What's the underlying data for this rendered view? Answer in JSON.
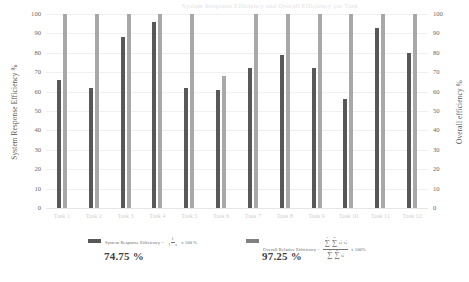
{
  "top_title": "System Response Efficiency and Overall Efficiency per Task",
  "axes": {
    "left_title": "System Response Efficiency %",
    "right_title": "Overall efficiency %",
    "ticks": [
      "100",
      "90",
      "80",
      "70",
      "60",
      "50",
      "40",
      "30",
      "20",
      "10",
      "0"
    ]
  },
  "legend": {
    "series1": {
      "label": "System Response Efficiency =",
      "numerator": "1",
      "denominator": "1 + s",
      "suffix": "x 100 %",
      "value": "74.75 %",
      "color": "#585858"
    },
    "series2": {
      "label": "Overall Relative Efficiency =",
      "num_sum1": "∑",
      "num_sum1_top": "n",
      "num_sum1_bot": "i=1",
      "num_sum2": "∑",
      "num_sum2_top": "m",
      "num_sum2_bot": "j=1",
      "num_term": "eᵢⱼ tᵢⱼ",
      "den_sum1": "∑",
      "den_sum1_top": "n",
      "den_sum1_bot": "i=1",
      "den_sum2": "∑",
      "den_sum2_top": "m",
      "den_sum2_bot": "j=1",
      "den_term": "tᵢⱼ",
      "suffix": "x 100%",
      "value": "97.25 %",
      "color": "#808080"
    }
  },
  "chart_data": {
    "type": "bar",
    "title": "System Response Efficiency and Overall Efficiency per Task",
    "xlabel": "",
    "ylabel": "System Response Efficiency %",
    "ylabel_right": "Overall efficiency %",
    "ylim": [
      0,
      100
    ],
    "yticks": [
      0,
      10,
      20,
      30,
      40,
      50,
      60,
      70,
      80,
      90,
      100
    ],
    "grid": true,
    "legend_position": "bottom",
    "categories": [
      "Task 1",
      "Task 2",
      "Task 3",
      "Task 4",
      "Task 5",
      "Task 6",
      "Task 7",
      "Task 8",
      "Task 9",
      "Task 10",
      "Task 11",
      "Task 12"
    ],
    "series": [
      {
        "name": "System Response Efficiency",
        "color": "#585858",
        "values": [
          66,
          62,
          88,
          96,
          62,
          61,
          72,
          79,
          72,
          56,
          93,
          80
        ]
      },
      {
        "name": "Overall Relative Efficiency",
        "color": "#a8a8a8",
        "values": [
          100,
          100,
          100,
          100,
          100,
          68,
          100,
          100,
          100,
          100,
          100,
          100
        ]
      }
    ],
    "summary": {
      "system_response_efficiency": "74.75 %",
      "overall_relative_efficiency": "97.25 %"
    }
  }
}
